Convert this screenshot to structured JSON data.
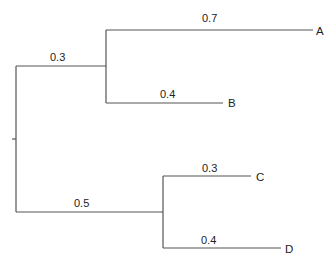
{
  "diagram": {
    "type": "phylogenetic-tree",
    "colors": {
      "line": "#555555",
      "text": "#222222",
      "background": "#ffffff"
    },
    "root": {
      "label": ""
    },
    "internal_branches": [
      {
        "id": "upper",
        "length_label": "0.3"
      },
      {
        "id": "lower",
        "length_label": "0.5"
      }
    ],
    "leaves": [
      {
        "name": "A",
        "length_label": "0.7"
      },
      {
        "name": "B",
        "length_label": "0.4"
      },
      {
        "name": "C",
        "length_label": "0.3"
      },
      {
        "name": "D",
        "length_label": "0.4"
      }
    ]
  }
}
